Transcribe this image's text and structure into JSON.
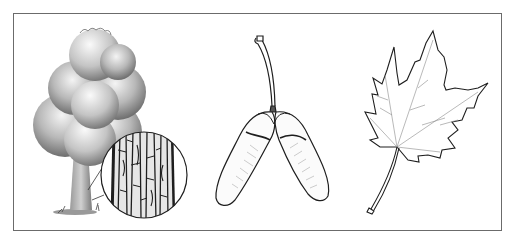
{
  "figure": {
    "panels": [
      {
        "id": "tree",
        "label": "Tree"
      },
      {
        "id": "bark",
        "label": "Bark detail"
      },
      {
        "id": "samara",
        "label": "Samara"
      },
      {
        "id": "leaf",
        "label": "Leaf"
      }
    ],
    "colors": {
      "border": "#6b6b6b",
      "ink": "#1e1e1e",
      "foliage_dark": "#5a5a5a",
      "foliage_light": "#d9d9d9",
      "background": "#ffffff"
    }
  }
}
